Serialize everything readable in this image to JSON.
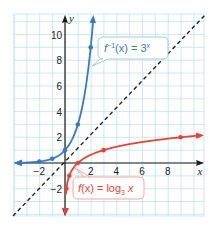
{
  "chart_data": {
    "type": "line",
    "title": "",
    "xlabel": "x",
    "ylabel": "y",
    "xlim": [
      -4,
      10.9
    ],
    "ylim": [
      -4,
      11.6
    ],
    "grid": true,
    "x_ticks": [
      -2,
      2,
      4,
      6,
      8
    ],
    "x_tick_labels": [
      "−2",
      "2",
      "4",
      "6",
      "8"
    ],
    "y_ticks": [
      -2,
      2,
      4,
      6,
      8,
      10
    ],
    "y_tick_labels": [
      "−2",
      "2",
      "4",
      "6",
      "8",
      "10"
    ],
    "series": [
      {
        "name": "f^-1(x) = 3^x",
        "label_parts": [
          "f",
          "−1",
          "(x) = 3",
          "x"
        ],
        "color": "#3a78c2",
        "function": "3^x",
        "points": [
          [
            -2,
            0.111
          ],
          [
            -1,
            0.333
          ],
          [
            0,
            1
          ],
          [
            1,
            3
          ],
          [
            2,
            9
          ]
        ],
        "arrows": "both"
      },
      {
        "name": "f(x) = log_3 x",
        "label_parts": [
          "f",
          "(x) = log",
          "3",
          " x"
        ],
        "color": "#e0463a",
        "function": "log3(x)",
        "points": [
          [
            0.111,
            -2
          ],
          [
            0.333,
            -1
          ],
          [
            1,
            0
          ],
          [
            3,
            1
          ],
          [
            9,
            2
          ]
        ],
        "arrows": "both"
      },
      {
        "name": "y = x",
        "color": "#222222",
        "style": "dashed",
        "function": "x",
        "points": [
          [
            -4,
            -4
          ],
          [
            10.9,
            10.9
          ]
        ]
      }
    ]
  },
  "colors": {
    "grid": "#bfe3ea",
    "axis": "#1a1a1a",
    "blue": "#3a78c2",
    "red": "#e0463a",
    "callout_blue_border": "#a9c6e4",
    "callout_red_border": "#f0a79f"
  }
}
